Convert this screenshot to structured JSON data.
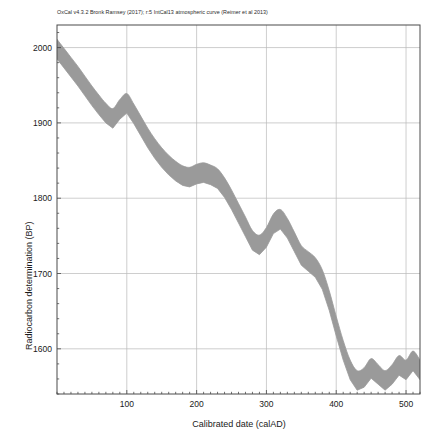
{
  "header": {
    "credit": "OxCal v4.3.2 Bronk Ramsey (2017); r:5 IntCal13 atmospheric curve (Reimer et al 2013)"
  },
  "axes": {
    "xlabel": "Calibrated date (calAD)",
    "ylabel": "Radiocarbon determination (BP)"
  },
  "chart_data": {
    "type": "area",
    "title": "",
    "subtitle": "OxCal v4.3.2 Bronk Ramsey (2017); r:5 IntCal13 atmospheric curve (Reimer et al 2013)",
    "xlabel": "Calibrated date (calAD)",
    "ylabel": "Radiocarbon determination (BP)",
    "xlim": [
      0,
      520
    ],
    "ylim": [
      1540,
      2030
    ],
    "xticks": [
      100,
      200,
      300,
      400,
      500
    ],
    "xtick_labels": [
      "100",
      "200",
      "300",
      "400",
      "500"
    ],
    "yticks": [
      1600,
      1700,
      1800,
      1900,
      2000
    ],
    "ytick_labels": [
      "1600",
      "1700",
      "1800",
      "1900",
      "2000"
    ],
    "x_minor_tick_step": 10,
    "y_minor_tick_step": 20,
    "grid": true,
    "grid_color": "#b9b9b9",
    "band_color": "#9a9a9a",
    "band_label": "IntCal13 atmospheric calibration curve (±1σ envelope)",
    "legend": "none",
    "x": [
      0,
      10,
      20,
      30,
      40,
      50,
      60,
      70,
      80,
      90,
      100,
      110,
      120,
      130,
      140,
      150,
      160,
      170,
      180,
      190,
      200,
      210,
      220,
      230,
      240,
      250,
      260,
      270,
      280,
      290,
      300,
      310,
      320,
      330,
      340,
      350,
      360,
      370,
      380,
      390,
      400,
      410,
      420,
      430,
      440,
      450,
      460,
      470,
      480,
      490,
      500,
      510,
      520
    ],
    "series": [
      {
        "name": "curve_mean",
        "values": [
          1998,
          1986,
          1974,
          1962,
          1949,
          1936,
          1924,
          1913,
          1906,
          1918,
          1926,
          1912,
          1896,
          1880,
          1866,
          1854,
          1844,
          1836,
          1830,
          1828,
          1832,
          1834,
          1831,
          1826,
          1814,
          1798,
          1780,
          1762,
          1744,
          1738,
          1748,
          1766,
          1772,
          1760,
          1742,
          1724,
          1716,
          1708,
          1692,
          1664,
          1630,
          1598,
          1572,
          1558,
          1562,
          1574,
          1566,
          1558,
          1566,
          1578,
          1572,
          1584,
          1572
        ]
      },
      {
        "name": "curve_upper",
        "values": [
          2011,
          1999,
          1987,
          1975,
          1962,
          1949,
          1937,
          1926,
          1919,
          1931,
          1939,
          1925,
          1909,
          1893,
          1879,
          1867,
          1857,
          1849,
          1843,
          1841,
          1845,
          1847,
          1844,
          1839,
          1827,
          1811,
          1793,
          1775,
          1757,
          1751,
          1761,
          1779,
          1785,
          1773,
          1755,
          1737,
          1729,
          1721,
          1705,
          1677,
          1643,
          1611,
          1585,
          1571,
          1575,
          1587,
          1579,
          1571,
          1579,
          1591,
          1585,
          1597,
          1585
        ]
      },
      {
        "name": "curve_lower",
        "values": [
          1985,
          1973,
          1961,
          1949,
          1936,
          1923,
          1911,
          1900,
          1893,
          1905,
          1913,
          1899,
          1883,
          1867,
          1853,
          1841,
          1831,
          1823,
          1817,
          1815,
          1819,
          1821,
          1818,
          1813,
          1801,
          1785,
          1767,
          1749,
          1731,
          1725,
          1735,
          1753,
          1759,
          1747,
          1729,
          1711,
          1703,
          1695,
          1679,
          1651,
          1617,
          1585,
          1559,
          1545,
          1549,
          1561,
          1553,
          1545,
          1553,
          1565,
          1559,
          1571,
          1559
        ]
      }
    ]
  }
}
